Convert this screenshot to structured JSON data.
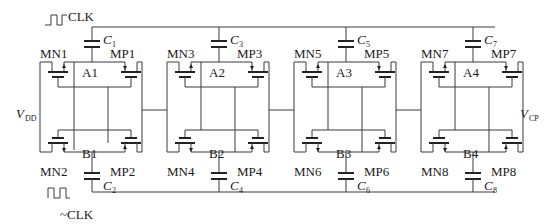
{
  "clock": {
    "clk_label": "CLK",
    "nclk_label": "~CLK"
  },
  "supply": {
    "vdd_main": "V",
    "vdd_sub": "DD",
    "vcp_main": "V",
    "vcp_sub": "CP"
  },
  "stages": [
    {
      "top_node": "A1",
      "bottom_node": "B1",
      "mn_top": "MN1",
      "mp_top": "MP1",
      "mn_bot": "MN2",
      "mp_bot": "MP2",
      "c_top": "C",
      "c_top_sub": "1",
      "c_bot": "C",
      "c_bot_sub": "2"
    },
    {
      "top_node": "A2",
      "bottom_node": "B2",
      "mn_top": "MN3",
      "mp_top": "MP3",
      "mn_bot": "MN4",
      "mp_bot": "MP4",
      "c_top": "C",
      "c_top_sub": "3",
      "c_bot": "C",
      "c_bot_sub": "4"
    },
    {
      "top_node": "A3",
      "bottom_node": "B3",
      "mn_top": "MN5",
      "mp_top": "MP5",
      "mn_bot": "MN6",
      "mp_bot": "MP6",
      "c_top": "C",
      "c_top_sub": "5",
      "c_bot": "C",
      "c_bot_sub": "6"
    },
    {
      "top_node": "A4",
      "bottom_node": "B4",
      "mn_top": "MN7",
      "mp_top": "MP7",
      "mn_bot": "MN8",
      "mp_bot": "MP8",
      "c_top": "C",
      "c_top_sub": "7",
      "c_bot": "C",
      "c_bot_sub": "8"
    }
  ],
  "colors": {
    "wire": "#3a3a3a",
    "text": "#1a1a1a",
    "background": "#ffffff"
  }
}
